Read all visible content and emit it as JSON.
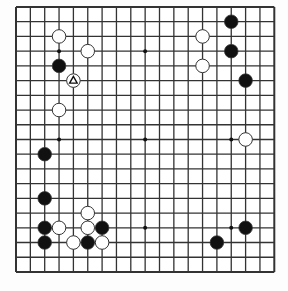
{
  "board": {
    "size": 19,
    "origin_x": 16,
    "origin_y": 7,
    "spacing_x": 14.35,
    "spacing_y": 14.72,
    "line_color": "#333333",
    "background": "#ffffff",
    "star_points": [
      [
        3,
        3
      ],
      [
        9,
        3
      ],
      [
        15,
        3
      ],
      [
        3,
        9
      ],
      [
        9,
        9
      ],
      [
        15,
        9
      ],
      [
        3,
        15
      ],
      [
        9,
        15
      ],
      [
        15,
        15
      ]
    ]
  },
  "stones": [
    {
      "color": "black",
      "col": 15,
      "row": 1
    },
    {
      "color": "black",
      "col": 15,
      "row": 3
    },
    {
      "color": "black",
      "col": 16,
      "row": 5
    },
    {
      "color": "black",
      "col": 3,
      "row": 4
    },
    {
      "color": "black",
      "col": 2,
      "row": 10
    },
    {
      "color": "black",
      "col": 2,
      "row": 13
    },
    {
      "color": "black",
      "col": 2,
      "row": 15
    },
    {
      "color": "black",
      "col": 2,
      "row": 16
    },
    {
      "color": "black",
      "col": 6,
      "row": 15
    },
    {
      "color": "black",
      "col": 5,
      "row": 16
    },
    {
      "color": "black",
      "col": 16,
      "row": 15
    },
    {
      "color": "black",
      "col": 14,
      "row": 16
    },
    {
      "color": "white",
      "col": 3,
      "row": 2
    },
    {
      "color": "white",
      "col": 5,
      "row": 3
    },
    {
      "color": "white",
      "col": 4,
      "row": 5,
      "marker": "triangle"
    },
    {
      "color": "white",
      "col": 3,
      "row": 7
    },
    {
      "color": "white",
      "col": 13,
      "row": 2
    },
    {
      "color": "white",
      "col": 13,
      "row": 4
    },
    {
      "color": "white",
      "col": 16,
      "row": 9
    },
    {
      "color": "white",
      "col": 3,
      "row": 15
    },
    {
      "color": "white",
      "col": 5,
      "row": 14
    },
    {
      "color": "white",
      "col": 5,
      "row": 15
    },
    {
      "color": "white",
      "col": 4,
      "row": 16
    },
    {
      "color": "white",
      "col": 6,
      "row": 16
    }
  ],
  "colors": {
    "black_stone": "#111111",
    "white_stone": "#ffffff",
    "stone_outline": "#333333"
  }
}
